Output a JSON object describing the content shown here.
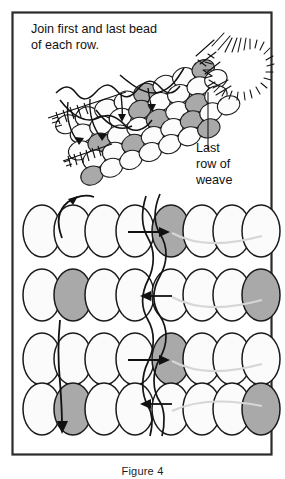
{
  "figure": {
    "title_caption": "Figure 4",
    "frame_color": "#2b2b2b",
    "background_color": "#ffffff",
    "bead_fill": "#fbfbfb",
    "bead_shaded_fill": "#a9a9a9",
    "bead_stroke": "#1a1a1a",
    "thread_color": "#141414",
    "thread_light_color": "#cfcfcf"
  },
  "annotations": {
    "instruction": {
      "line1": "Join first and last bead",
      "line2": "of each row."
    },
    "callout": {
      "line1": "Last",
      "line2": "row of",
      "line3": "weave"
    }
  },
  "top_illustration": {
    "name": "perspective-beadwork-tube",
    "description": "Angled three-dimensional view of a peyote-stitch beaded band with needle and thread joining the first and last bead of each row",
    "needle_marks": "hatched-needle-sketch",
    "arrow_count": 4,
    "arrow_direction": "down",
    "shaded_bead_count": 9
  },
  "bottom_diagram": {
    "name": "flat-weave-rows",
    "row_count": 4,
    "beads_per_row": 8,
    "rows": [
      {
        "index": 1,
        "shaded_positions": [
          5
        ],
        "join_arrow": "right"
      },
      {
        "index": 2,
        "shaded_positions": [
          2,
          8
        ],
        "join_arrow": "left"
      },
      {
        "index": 3,
        "shaded_positions": [
          5
        ],
        "join_arrow": "right"
      },
      {
        "index": 4,
        "shaded_positions": [
          2,
          8
        ],
        "join_arrow": "left"
      }
    ],
    "entry_arrow": "curved-up-left",
    "exit_arrow": "straight-down"
  }
}
